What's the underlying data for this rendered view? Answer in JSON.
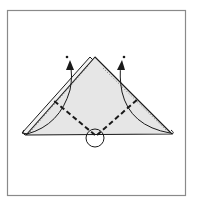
{
  "diagram": {
    "type": "origami-instruction-step",
    "elements": {
      "frame": "panel-border",
      "paper": "folded-triangle",
      "back_layer": "triangle-back-layer",
      "fold_lines": [
        "valley-fold-left",
        "valley-fold-right"
      ],
      "arrows": [
        "lift-arrow-left",
        "lift-arrow-right"
      ],
      "marker": "center-point-circle"
    },
    "colors": {
      "paper_fill": "#e6e6e6",
      "stroke": "#1a1a1a",
      "frame": "#8a8a8a",
      "background": "#ffffff"
    }
  }
}
